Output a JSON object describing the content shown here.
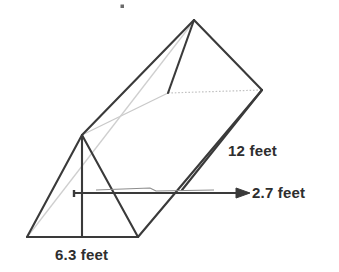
{
  "figure": {
    "name": "triangular-prism-diagram",
    "shape": "triangular prism",
    "background_color": "#ffffff",
    "line_color": "#3a3a3a",
    "hidden_line_color": "#b9b9b9",
    "label_color": "#2e2e2e"
  },
  "labels": {
    "length": "12 feet",
    "height": "2.7 feet",
    "base": "6.3 feet"
  },
  "measurements": [
    {
      "id": "length",
      "value": 12,
      "unit": "feet",
      "text": "12 feet",
      "edge": "prism length (lateral edge)"
    },
    {
      "id": "height",
      "value": 2.7,
      "unit": "feet",
      "text": "2.7 feet",
      "edge": "triangle height (altitude)"
    },
    {
      "id": "base",
      "value": 6.3,
      "unit": "feet",
      "text": "6.3 feet",
      "edge": "triangle base"
    }
  ],
  "geometry": {
    "front_triangle": {
      "apex": [
        82,
        135
      ],
      "bottom_left": [
        27,
        237
      ],
      "bottom_right": [
        138,
        237
      ],
      "altitude_foot": [
        82,
        237
      ]
    },
    "back_triangle": {
      "apex": [
        194,
        20
      ],
      "lower_left": [
        168,
        93
      ],
      "lower_right": [
        262,
        90
      ]
    },
    "hidden_edges": [
      {
        "from": [
          168,
          93
        ],
        "to": [
          262,
          90
        ],
        "style": "dotted"
      },
      {
        "from": [
          82,
          135
        ],
        "to": [
          168,
          93
        ],
        "style": "faint"
      },
      {
        "from": [
          27,
          237
        ],
        "to": [
          194,
          20
        ],
        "style": "faint"
      }
    ],
    "height_arrow": {
      "from": [
        73,
        193
      ],
      "to": [
        250,
        193
      ]
    },
    "speck": [
      122,
      6
    ]
  }
}
